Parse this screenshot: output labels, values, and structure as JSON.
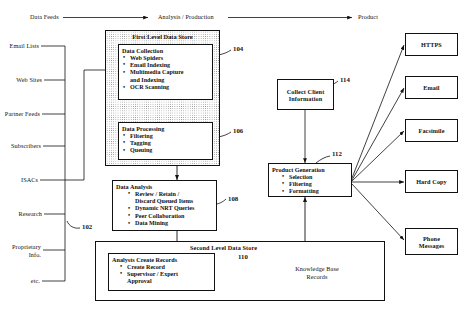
{
  "figure": {
    "top_flow": {
      "stage1_label": "Data Feeds",
      "stage2_label": "Analysis / Production",
      "stage3_label": "Product"
    },
    "sources": {
      "ref": "102",
      "items": [
        "Email Lists",
        "Web Sites",
        "Partner Feeds",
        "Subscribers",
        "ISACs",
        "Research",
        "Proprietary Info.",
        "etc."
      ]
    },
    "first_level_store": {
      "title": "First Level Data Store",
      "blocks": [
        {
          "ref": "104",
          "title": "Data Collection",
          "bullets": [
            "Web Spiders",
            "Email Indexing",
            "Multimedia Capture",
            "and Indexing",
            "OCR Scanning"
          ]
        },
        {
          "ref": "106",
          "title": "Data Processing",
          "bullets": [
            "Filtering",
            "Tagging",
            "Queuing"
          ]
        }
      ]
    },
    "data_analysis": {
      "ref": "108",
      "title": "Data Analysis",
      "bullets": [
        "Review / Retain /",
        "Discard Queued Items",
        "Dynamic NRT Queries",
        "Peer Collaboration",
        "Data Mining"
      ]
    },
    "second_level_store": {
      "title": "Second Level Data Store",
      "ref": "110",
      "analysts_block": {
        "title": "Analysts Create Records",
        "bullets": [
          "Create Record",
          "Supervisor / Expert",
          "Approval"
        ]
      },
      "database": {
        "line1": "Knowledge Base",
        "line2": "Records"
      }
    },
    "collect_client": {
      "ref": "114",
      "line1": "Collect Client",
      "line2": "Information"
    },
    "product_generation": {
      "ref": "112",
      "title": "Product Generation",
      "bullets": [
        "Selection",
        "Filtering",
        "Formatting"
      ]
    },
    "outputs": [
      {
        "label": "HTTPS"
      },
      {
        "label": "Email"
      },
      {
        "label": "Facsimile"
      },
      {
        "label": "Hard Copy"
      },
      {
        "label": "Phone",
        "label2": "Messages"
      }
    ]
  }
}
